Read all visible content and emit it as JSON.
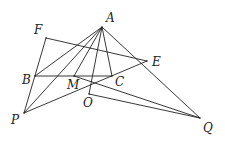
{
  "diagram": {
    "type": "geometry",
    "points": {
      "A": {
        "x": 102,
        "y": 27,
        "label": "A",
        "lx": 106,
        "ly": 22
      },
      "F": {
        "x": 46,
        "y": 38,
        "label": "F",
        "lx": 34,
        "ly": 34
      },
      "B": {
        "x": 35,
        "y": 76,
        "label": "B",
        "lx": 22,
        "ly": 84
      },
      "M": {
        "x": 74,
        "y": 76,
        "label": "M",
        "lx": 67,
        "ly": 89
      },
      "C": {
        "x": 112,
        "y": 76,
        "label": "C",
        "lx": 115,
        "ly": 86
      },
      "E": {
        "x": 147,
        "y": 61,
        "label": "E",
        "lx": 152,
        "ly": 66
      },
      "O": {
        "x": 89,
        "y": 94,
        "label": "O",
        "lx": 83,
        "ly": 107
      },
      "P": {
        "x": 24,
        "y": 113,
        "label": "P",
        "lx": 11,
        "ly": 124
      },
      "Q": {
        "x": 200,
        "y": 118,
        "label": "Q",
        "lx": 203,
        "ly": 132
      }
    },
    "segments": [
      [
        "F",
        "P"
      ],
      [
        "F",
        "E"
      ],
      [
        "B",
        "C"
      ],
      [
        "A",
        "B"
      ],
      [
        "A",
        "P"
      ],
      [
        "A",
        "M"
      ],
      [
        "A",
        "O"
      ],
      [
        "A",
        "C"
      ],
      [
        "A",
        "Q"
      ],
      [
        "P",
        "E"
      ],
      [
        "M",
        "Q"
      ],
      [
        "O",
        "Q"
      ]
    ]
  }
}
